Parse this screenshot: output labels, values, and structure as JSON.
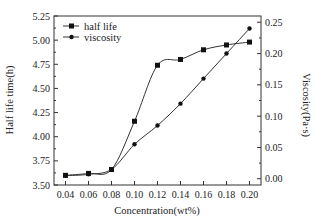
{
  "chart_data": {
    "type": "line",
    "title": "",
    "xlabel": "Concentration(wt%)",
    "ylabel": "Half life time(h)",
    "ylabel_right": "Viscosity(Pa·s)",
    "x": [
      0.04,
      0.06,
      0.08,
      0.1,
      0.12,
      0.14,
      0.16,
      0.18,
      0.2
    ],
    "x_ticks": [
      "0.04",
      "0.06",
      "0.08",
      "0.10",
      "0.12",
      "0.14",
      "0.16",
      "0.18",
      "0.20"
    ],
    "y_ticks_left": [
      "3.50",
      "3.75",
      "4.00",
      "4.25",
      "4.50",
      "4.75",
      "5.00",
      "5.25"
    ],
    "y_ticks_right": [
      "0.00",
      "0.05",
      "0.10",
      "0.15",
      "0.20",
      "0.25"
    ],
    "xlim": [
      0.03,
      0.21
    ],
    "ylim_left": [
      3.5,
      5.25
    ],
    "ylim_right": [
      -0.01,
      0.26
    ],
    "grid": false,
    "legend_position": "upper left",
    "series": [
      {
        "name": "half life",
        "axis": "left",
        "marker": "square",
        "values": [
          3.6,
          3.62,
          3.66,
          4.16,
          4.74,
          4.8,
          4.9,
          4.95,
          4.98
        ]
      },
      {
        "name": "viscosity",
        "axis": "right",
        "marker": "circle",
        "values": [
          0.005,
          0.007,
          0.015,
          0.055,
          0.085,
          0.12,
          0.16,
          0.2,
          0.24
        ]
      }
    ]
  }
}
